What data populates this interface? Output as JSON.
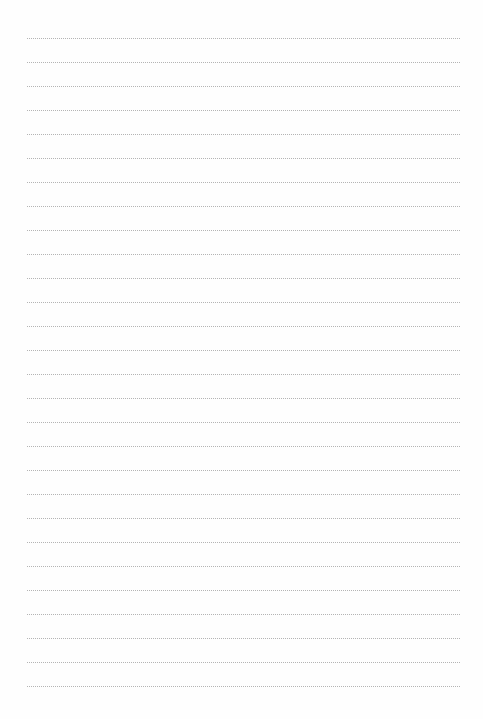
{
  "page": {
    "type": "ruled-lined-paper",
    "background_color": "#fefefe",
    "line_color": "#b4b4b4",
    "line_style": "dotted",
    "line_count": 28,
    "first_line_y": 38,
    "line_spacing": 24,
    "line_left": 27,
    "line_right": 460
  }
}
